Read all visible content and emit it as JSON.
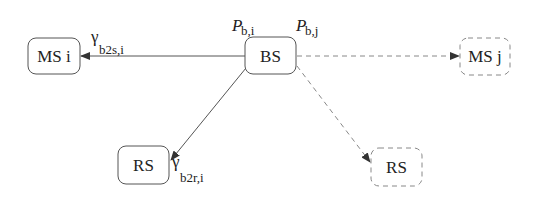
{
  "nodes": {
    "ms_i": {
      "label": "MS i",
      "style": "solid"
    },
    "bs": {
      "label": "BS",
      "style": "solid"
    },
    "ms_j": {
      "label": "MS j",
      "style": "dashed"
    },
    "rs_left": {
      "label": "RS",
      "style": "solid"
    },
    "rs_right": {
      "label": "RS",
      "style": "dashed"
    }
  },
  "edges": [
    {
      "from": "bs",
      "to": "ms_i",
      "style": "solid"
    },
    {
      "from": "bs",
      "to": "rs_left",
      "style": "solid"
    },
    {
      "from": "bs",
      "to": "ms_j",
      "style": "dashed"
    },
    {
      "from": "bs",
      "to": "rs_right",
      "style": "dashed"
    }
  ],
  "labels": {
    "gamma_b2s": {
      "main": "γ",
      "sub": "b2s,i"
    },
    "gamma_b2r": {
      "main": "γ",
      "sub": "b2r,i"
    },
    "p_bi": {
      "main": "P",
      "sub": "b,i"
    },
    "p_bj": {
      "main": "P",
      "sub": "b,j"
    }
  }
}
